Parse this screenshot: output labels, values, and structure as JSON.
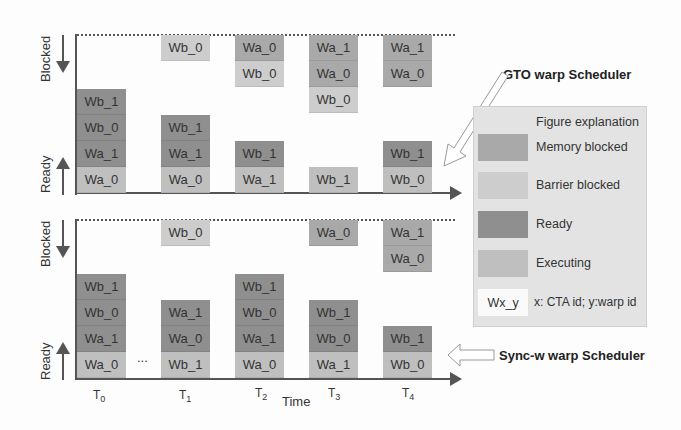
{
  "diagram": {
    "y_labels": {
      "blocked": "Blocked",
      "ready": "Ready"
    },
    "x_label": "Time",
    "ellipsis": "...",
    "time_ticks": [
      {
        "base": "T",
        "sub": "0"
      },
      {
        "base": "T",
        "sub": "1"
      },
      {
        "base": "T",
        "sub": "2"
      },
      {
        "base": "T",
        "sub": "3"
      },
      {
        "base": "T",
        "sub": "4"
      }
    ],
    "panels": [
      {
        "name": "GTO warp Scheduler",
        "columns": [
          {
            "time": "T0",
            "blocked": [],
            "ready_bottom_up": [
              {
                "label": "Wa_0",
                "state": "executing"
              },
              {
                "label": "Wa_1",
                "state": "ready"
              },
              {
                "label": "Wb_0",
                "state": "ready"
              },
              {
                "label": "Wb_1",
                "state": "ready"
              }
            ]
          },
          {
            "time": "T1",
            "blocked": [
              {
                "label": "Wb_0",
                "state": "barrier"
              }
            ],
            "ready_bottom_up": [
              {
                "label": "Wa_0",
                "state": "executing"
              },
              {
                "label": "Wa_1",
                "state": "ready"
              },
              {
                "label": "Wb_1",
                "state": "ready"
              }
            ]
          },
          {
            "time": "T2",
            "blocked": [
              {
                "label": "Wa_0",
                "state": "memory"
              },
              {
                "label": "Wb_0",
                "state": "barrier"
              }
            ],
            "ready_bottom_up": [
              {
                "label": "Wa_1",
                "state": "executing"
              },
              {
                "label": "Wb_1",
                "state": "ready"
              }
            ]
          },
          {
            "time": "T3",
            "blocked": [
              {
                "label": "Wa_1",
                "state": "memory"
              },
              {
                "label": "Wa_0",
                "state": "memory"
              },
              {
                "label": "Wb_0",
                "state": "barrier"
              }
            ],
            "ready_bottom_up": [
              {
                "label": "Wb_1",
                "state": "executing"
              }
            ]
          },
          {
            "time": "T4",
            "blocked": [
              {
                "label": "Wa_1",
                "state": "memory"
              },
              {
                "label": "Wa_0",
                "state": "memory"
              }
            ],
            "ready_bottom_up": [
              {
                "label": "Wb_0",
                "state": "executing"
              },
              {
                "label": "Wb_1",
                "state": "ready"
              }
            ]
          }
        ]
      },
      {
        "name": "Sync-w warp Scheduler",
        "columns": [
          {
            "time": "T0",
            "blocked": [],
            "ready_bottom_up": [
              {
                "label": "Wa_0",
                "state": "executing"
              },
              {
                "label": "Wa_1",
                "state": "ready"
              },
              {
                "label": "Wb_0",
                "state": "ready"
              },
              {
                "label": "Wb_1",
                "state": "ready"
              }
            ]
          },
          {
            "time": "T1",
            "blocked": [
              {
                "label": "Wb_0",
                "state": "barrier"
              }
            ],
            "ready_bottom_up": [
              {
                "label": "Wb_1",
                "state": "executing"
              },
              {
                "label": "Wa_0",
                "state": "ready"
              },
              {
                "label": "Wa_1",
                "state": "ready"
              }
            ]
          },
          {
            "time": "T2",
            "blocked": [],
            "ready_bottom_up": [
              {
                "label": "Wa_0",
                "state": "executing"
              },
              {
                "label": "Wa_1",
                "state": "ready"
              },
              {
                "label": "Wb_0",
                "state": "ready"
              },
              {
                "label": "Wb_1",
                "state": "ready"
              }
            ]
          },
          {
            "time": "T3",
            "blocked": [
              {
                "label": "Wa_0",
                "state": "memory"
              }
            ],
            "ready_bottom_up": [
              {
                "label": "Wa_1",
                "state": "executing"
              },
              {
                "label": "Wb_0",
                "state": "ready"
              },
              {
                "label": "Wb_1",
                "state": "ready"
              }
            ]
          },
          {
            "time": "T4",
            "blocked": [
              {
                "label": "Wa_1",
                "state": "memory"
              },
              {
                "label": "Wa_0",
                "state": "memory"
              }
            ],
            "ready_bottom_up": [
              {
                "label": "Wb_0",
                "state": "executing"
              },
              {
                "label": "Wb_1",
                "state": "ready"
              }
            ]
          }
        ]
      }
    ],
    "legend": {
      "title": "Figure explanation",
      "items": [
        {
          "state": "memory",
          "label": "Memory blocked",
          "color": "#a9a9a9"
        },
        {
          "state": "barrier",
          "label": "Barrier blocked",
          "color": "#cdcdcd"
        },
        {
          "state": "ready",
          "label": "Ready",
          "color": "#8f8f8f"
        },
        {
          "state": "executing",
          "label": "Executing",
          "color": "#bfbfbf"
        }
      ],
      "notation": {
        "sample": "Wx_y",
        "text": "x: CTA id; y:warp id"
      }
    },
    "callouts": {
      "gto": "GTO warp Scheduler",
      "syncw": "Sync-w warp Scheduler"
    }
  }
}
